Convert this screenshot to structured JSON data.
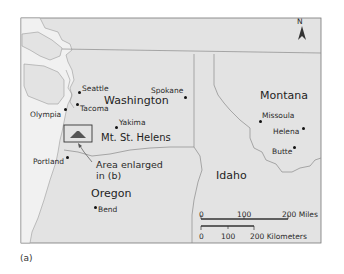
{
  "figure": {
    "caption": "(a)"
  },
  "colors": {
    "land": "#e3e3e3",
    "water": "#f0f0f0",
    "border": "#8a8a8a",
    "frame": "#777777",
    "text": "#2a2a2a"
  },
  "north_arrow": {
    "label": "N",
    "icon": "north-arrow-icon"
  },
  "states": [
    {
      "name": "Washington"
    },
    {
      "name": "Oregon"
    },
    {
      "name": "Idaho"
    },
    {
      "name": "Montana"
    }
  ],
  "cities": [
    {
      "name": "Seattle"
    },
    {
      "name": "Tacoma"
    },
    {
      "name": "Olympia"
    },
    {
      "name": "Yakima"
    },
    {
      "name": "Spokane"
    },
    {
      "name": "Portland"
    },
    {
      "name": "Bend"
    },
    {
      "name": "Missoula"
    },
    {
      "name": "Helena"
    },
    {
      "name": "Butte"
    }
  ],
  "feature": {
    "name": "Mt. St. Helens",
    "inset_note": "Area enlarged in (b)",
    "inset_line1": "Area enlarged",
    "inset_line2": "in (b)",
    "icon": "volcano-icon"
  },
  "scale_bar": {
    "miles": {
      "ticks": [
        "0",
        "100",
        "200 Miles"
      ]
    },
    "kilometers": {
      "ticks": [
        "0",
        "100",
        "200 Kilometers"
      ]
    }
  }
}
